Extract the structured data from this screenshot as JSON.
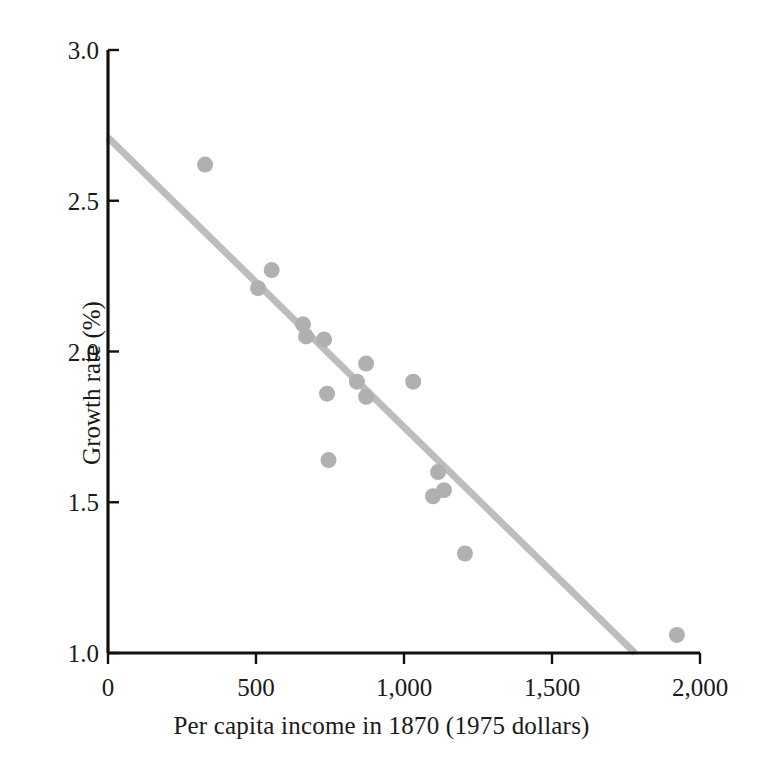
{
  "chart_data": {
    "type": "scatter",
    "title": "",
    "xlabel": "Per capita income in 1870 (1975 dollars)",
    "ylabel": "Growth rate (%)",
    "xlim": [
      0,
      2000
    ],
    "ylim": [
      1.0,
      3.0
    ],
    "xticks": [
      0,
      500,
      1000,
      1500,
      2000
    ],
    "xticklabels": [
      "0",
      "500",
      "1,000",
      "1,500",
      "2,000"
    ],
    "yticks": [
      1.0,
      1.5,
      2.0,
      2.5,
      3.0
    ],
    "yticklabels": [
      "1.0",
      "1.5",
      "2.0",
      "2.5",
      "3.0"
    ],
    "grid": false,
    "legend": "none",
    "marker_color": "#b0b0b0",
    "marker_radius": 8,
    "line_color": "#bdbdbd",
    "line_width": 7,
    "axis_color": "#111111",
    "points": [
      {
        "x": 328,
        "y": 2.62
      },
      {
        "x": 507,
        "y": 2.21
      },
      {
        "x": 553,
        "y": 2.27
      },
      {
        "x": 659,
        "y": 2.09
      },
      {
        "x": 669,
        "y": 2.05
      },
      {
        "x": 730,
        "y": 2.04
      },
      {
        "x": 740,
        "y": 1.86
      },
      {
        "x": 745,
        "y": 1.64
      },
      {
        "x": 872,
        "y": 1.96
      },
      {
        "x": 841,
        "y": 1.9
      },
      {
        "x": 872,
        "y": 1.85
      },
      {
        "x": 1031,
        "y": 1.9
      },
      {
        "x": 1115,
        "y": 1.6
      },
      {
        "x": 1098,
        "y": 1.52
      },
      {
        "x": 1135,
        "y": 1.54
      },
      {
        "x": 1206,
        "y": 1.33
      },
      {
        "x": 1922,
        "y": 1.06
      }
    ],
    "trendline": {
      "x_start": 0,
      "y_start": 2.71,
      "x_end": 1780,
      "y_end": 1.0
    }
  },
  "axes": {
    "x_label": "Per capita income in 1870 (1975 dollars)",
    "y_label": "Growth rate (%)"
  }
}
